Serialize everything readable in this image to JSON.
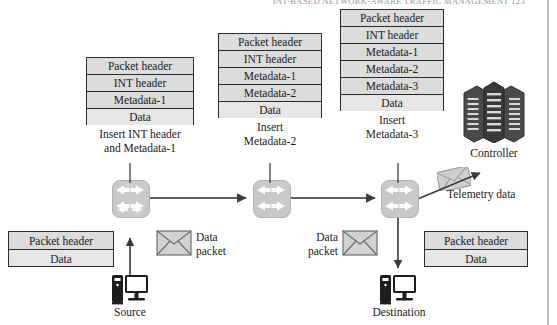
{
  "page": {
    "running_head": "INT-BASED NETWORK-AWARE TRAFFIC MANAGEMENT    123",
    "background": "#ffffff",
    "box_fill": "#dcdcdc",
    "box_fill_data": "#e6e6e6",
    "box_border": "#2b2b2b",
    "switch_fill": "#c9c9c9",
    "icon_dark": "#3a3a3a"
  },
  "stacks": [
    {
      "id": "stack-hop-1",
      "rows": [
        "Packet header",
        "INT header",
        "Metadata-1",
        "Data"
      ],
      "caption_line1": "Insert INT header",
      "caption_line2": "and Metadata-1"
    },
    {
      "id": "stack-hop-2",
      "rows": [
        "Packet header",
        "INT header",
        "Metadata-1",
        "Metadata-2",
        "Data"
      ],
      "caption_line1": "Insert",
      "caption_line2": "Metadata-2"
    },
    {
      "id": "stack-hop-3",
      "rows": [
        "Packet header",
        "INT header",
        "Metadata-1",
        "Metadata-2",
        "Metadata-3",
        "Data"
      ],
      "caption_line1": "Insert",
      "caption_line2": "Metadata-3"
    }
  ],
  "source_packet": {
    "id": "packet-source",
    "rows": [
      "Packet header",
      "Data"
    ]
  },
  "destination_packet": {
    "id": "packet-destination",
    "rows": [
      "Packet header",
      "Data"
    ]
  },
  "labels": {
    "controller": "Controller",
    "telemetry": "Telemetry data",
    "source": "Source",
    "destination": "Destination",
    "data_packet_left_line1": "Data",
    "data_packet_left_line2": "packet",
    "data_packet_right_line1": "Data",
    "data_packet_right_line2": "packet"
  },
  "icons": {
    "switch_1": "network-switch-icon",
    "switch_2": "network-switch-icon",
    "switch_3": "network-switch-icon",
    "controller": "server-rack-icon",
    "envelope_left": "envelope-icon",
    "envelope_right": "envelope-icon",
    "envelope_telemetry": "envelope-icon",
    "source_host": "desktop-computer-icon",
    "destination_host": "desktop-computer-icon"
  }
}
